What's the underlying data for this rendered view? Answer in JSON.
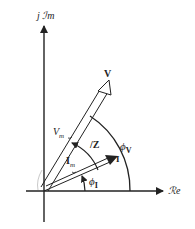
{
  "diagram": {
    "axes": {
      "imaginary_label": "j ℐm",
      "real_label": "ℛe"
    },
    "phasors": {
      "V": "V",
      "I": "I",
      "Vm": "V",
      "Vm_sub": "m",
      "Im": "I",
      "Im_sub": "m"
    },
    "angles": {
      "Z": "/Z",
      "phi_V": "ϕ",
      "phi_V_sub": "V",
      "phi_I": "ϕ",
      "phi_I_sub": "I"
    },
    "colors": {
      "line": "#222222",
      "background": "#ffffff"
    }
  }
}
